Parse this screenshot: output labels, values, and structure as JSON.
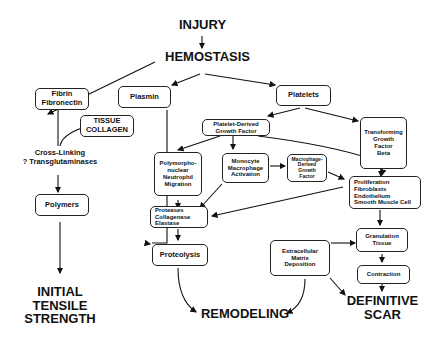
{
  "title": "INJURY",
  "nodes": {
    "hemostasis": "HEMOSTASIS",
    "fibrin": "Fibrin\nFibronectin",
    "tissue_collagen": "TISSUE\nCOLLAGEN",
    "cross_linking": "Cross-Linking\n? Transglutaminases",
    "polymers": "Polymers",
    "initial_tensile_strength": "INITIAL\nTENSILE\nSTRENGTH",
    "plasmin": "Plasmin",
    "platelets": "Platelets",
    "pdgf": "Platelet-Derived\nGrowth Factor",
    "tgf_beta": "Transforming\nGrowth\nFactor\nBeta",
    "pmn": "Polymorpho-\nnuclear\nNeutrophil\nMigration",
    "monocyte": "Monocyte\nMacrophage\nActivation",
    "mdgf": "Macrophage-\nDerived\nGrowth\nFactor",
    "proliferation": "Proliferation\n  Fibroblasts\n  Endothelium\n  Smooth Muscle Cell",
    "proteases": "Proteases\n  Collagenase\n  Elastase",
    "proteolysis": "Proteolysis",
    "ecm": "Extracellular\nMatrix\nDeposition",
    "granulation": "Granulation\nTissue",
    "contraction": "Contraction",
    "remodeling": "REMODELING",
    "definitive_scar": "DEFINITIVE\nSCAR"
  }
}
